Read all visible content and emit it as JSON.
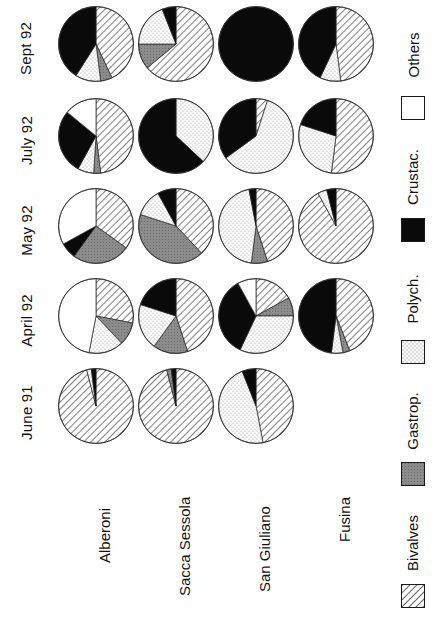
{
  "figure": {
    "orientation": "rotated-90-ccw",
    "row_labels": [
      "Sept 92",
      "July 92",
      "May 92",
      "April 92",
      "June 91"
    ],
    "column_labels": [
      "Alberoni",
      "Sacca Sessola",
      "San Giuliano",
      "Fusina"
    ]
  },
  "legend": {
    "items": [
      {
        "label": "Others",
        "fill": "others",
        "color": "#ffffff"
      },
      {
        "label": "Crustac.",
        "fill": "crustac",
        "color": "#000000"
      },
      {
        "label": "Polych.",
        "fill": "polych",
        "color": "#f2f2f2"
      },
      {
        "label": "Gastrop.",
        "fill": "gastrop",
        "color": "#8c8c8c"
      },
      {
        "label": "Bivalves",
        "fill": "bivalves",
        "color": "#ffffff"
      }
    ]
  },
  "chart_data": {
    "type": "pie",
    "title": "",
    "xlabel": "",
    "ylabel": "",
    "categories": [
      "Bivalves",
      "Gastrop.",
      "Polych.",
      "Crustac.",
      "Others"
    ],
    "rows": [
      "Sept 92",
      "July 92",
      "May 92",
      "April 92",
      "June 91"
    ],
    "columns": [
      "Alberoni",
      "Sacca Sessola",
      "San Giuliano",
      "Fusina"
    ],
    "units": "percent",
    "pies": [
      {
        "row": "Sept 92",
        "column": "Alberoni",
        "values": {
          "Bivalves": 43,
          "Gastrop.": 5,
          "Polych.": 11,
          "Crustac.": 41,
          "Others": 0
        }
      },
      {
        "row": "Sept 92",
        "column": "Sacca Sessola",
        "values": {
          "Bivalves": 64,
          "Gastrop.": 11,
          "Polych.": 19,
          "Crustac.": 6,
          "Others": 0
        }
      },
      {
        "row": "Sept 92",
        "column": "San Giuliano",
        "values": {
          "Bivalves": 0,
          "Gastrop.": 0,
          "Polych.": 0,
          "Crustac.": 100,
          "Others": 0
        }
      },
      {
        "row": "Sept 92",
        "column": "Fusina",
        "values": {
          "Bivalves": 48,
          "Gastrop.": 0,
          "Polych.": 9,
          "Crustac.": 43,
          "Others": 0
        }
      },
      {
        "row": "July 92",
        "column": "Alberoni",
        "values": {
          "Bivalves": 48,
          "Gastrop.": 3,
          "Polych.": 7,
          "Crustac.": 28,
          "Others": 14
        }
      },
      {
        "row": "July 92",
        "column": "Sacca Sessola",
        "values": {
          "Bivalves": 0,
          "Gastrop.": 0,
          "Polych.": 37,
          "Crustac.": 63,
          "Others": 0
        }
      },
      {
        "row": "July 92",
        "column": "San Giuliano",
        "values": {
          "Bivalves": 5,
          "Gastrop.": 0,
          "Polych.": 60,
          "Crustac.": 35,
          "Others": 0
        }
      },
      {
        "row": "July 92",
        "column": "Fusina",
        "values": {
          "Bivalves": 52,
          "Gastrop.": 0,
          "Polych.": 28,
          "Crustac.": 20,
          "Others": 0
        }
      },
      {
        "row": "May 92",
        "column": "Alberoni",
        "values": {
          "Bivalves": 35,
          "Gastrop.": 25,
          "Polych.": 0,
          "Crustac.": 7,
          "Others": 33
        }
      },
      {
        "row": "May 92",
        "column": "Sacca Sessola",
        "values": {
          "Bivalves": 38,
          "Gastrop.": 42,
          "Polych.": 12,
          "Crustac.": 8,
          "Others": 0
        }
      },
      {
        "row": "May 92",
        "column": "San Giuliano",
        "values": {
          "Bivalves": 45,
          "Gastrop.": 7,
          "Polych.": 45,
          "Crustac.": 3,
          "Others": 0
        }
      },
      {
        "row": "May 92",
        "column": "Fusina",
        "values": {
          "Bivalves": 92,
          "Gastrop.": 0,
          "Polych.": 4,
          "Crustac.": 4,
          "Others": 0
        }
      },
      {
        "row": "April 92",
        "column": "Alberoni",
        "values": {
          "Bivalves": 28,
          "Gastrop.": 10,
          "Polych.": 15,
          "Crustac.": 0,
          "Others": 47
        }
      },
      {
        "row": "April 92",
        "column": "Sacca Sessola",
        "values": {
          "Bivalves": 45,
          "Gastrop.": 15,
          "Polych.": 20,
          "Crustac.": 20,
          "Others": 0
        }
      },
      {
        "row": "April 92",
        "column": "San Giuliano",
        "values": {
          "Bivalves": 17,
          "Gastrop.": 8,
          "Polych.": 32,
          "Crustac.": 35,
          "Others": 8
        }
      },
      {
        "row": "April 92",
        "column": "Fusina",
        "values": {
          "Bivalves": 44,
          "Gastrop.": 3,
          "Polych.": 5,
          "Crustac.": 48,
          "Others": 0
        }
      },
      {
        "row": "June 91",
        "column": "Alberoni",
        "values": {
          "Bivalves": 96,
          "Gastrop.": 0,
          "Polych.": 2,
          "Crustac.": 2,
          "Others": 0
        }
      },
      {
        "row": "June 91",
        "column": "Sacca Sessola",
        "values": {
          "Bivalves": 96,
          "Gastrop.": 2,
          "Polych.": 0,
          "Crustac.": 2,
          "Others": 0
        }
      },
      {
        "row": "June 91",
        "column": "San Giuliano",
        "values": {
          "Bivalves": 47,
          "Gastrop.": 0,
          "Polych.": 47,
          "Crustac.": 6,
          "Others": 0
        }
      },
      {
        "row": "June 91",
        "column": "Fusina",
        "values": null
      }
    ]
  }
}
